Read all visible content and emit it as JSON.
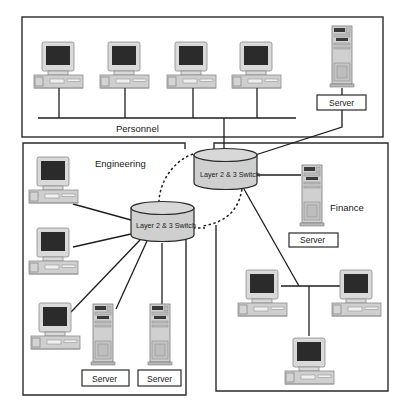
{
  "diagram": {
    "type": "network-topology",
    "zones": [
      {
        "id": "personnel",
        "label": "Personnel"
      },
      {
        "id": "engineering",
        "label": "Engineering"
      },
      {
        "id": "finance",
        "label": "Finance"
      }
    ],
    "switches": [
      {
        "id": "core-switch",
        "label": "Layer 2 & 3 Switch",
        "zone": "finance"
      },
      {
        "id": "eng-switch",
        "label": "Layer 2 & 3 Switch",
        "zone": "engineering"
      }
    ],
    "servers": [
      {
        "id": "personnel-server",
        "label": "Server",
        "zone": "personnel"
      },
      {
        "id": "finance-server",
        "label": "Server",
        "zone": "finance"
      },
      {
        "id": "eng-server-1",
        "label": "Server",
        "zone": "engineering"
      },
      {
        "id": "eng-server-2",
        "label": "Server",
        "zone": "engineering"
      }
    ],
    "workstations": {
      "personnel": 4,
      "engineering": 3,
      "finance": 3
    },
    "links": [
      {
        "from": "personnel-bus",
        "to": "core-switch",
        "style": "solid"
      },
      {
        "from": "personnel-server",
        "to": "core-switch",
        "style": "solid"
      },
      {
        "from": "core-switch",
        "to": "finance-server",
        "style": "solid"
      },
      {
        "from": "core-switch",
        "to": "finance-hub",
        "style": "solid"
      },
      {
        "from": "eng-switch",
        "to": "eng-workstations",
        "style": "solid"
      },
      {
        "from": "eng-switch",
        "to": "eng-servers",
        "style": "solid"
      },
      {
        "from": "core-switch",
        "to": "eng-switch",
        "style": "dashed",
        "note": "redundant loop"
      }
    ]
  }
}
